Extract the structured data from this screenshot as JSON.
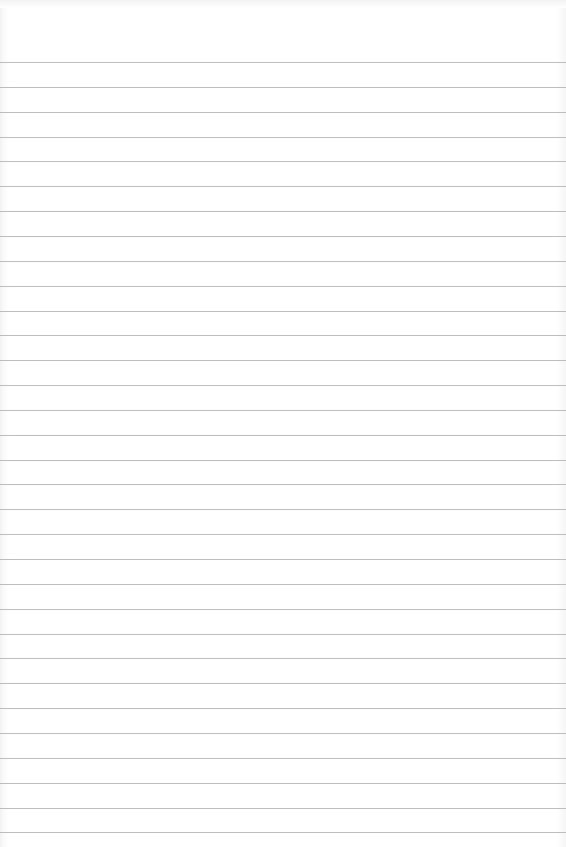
{
  "page": {
    "type": "blank ruled paper",
    "background_color": "#ffffff",
    "rule_color": "#bdbdbd",
    "first_rule_y": 62,
    "rule_spacing": 24.85,
    "rule_count": 32
  }
}
